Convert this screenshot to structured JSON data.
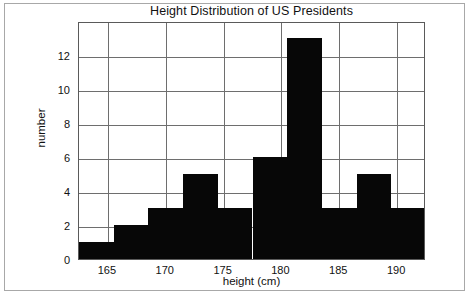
{
  "chart_data": {
    "type": "bar",
    "title": "Height Distribution of US Presidents",
    "xlabel": "height (cm)",
    "ylabel": "number",
    "grid": true,
    "legend": null,
    "xlim": [
      162.5,
      192.5
    ],
    "ylim": [
      0,
      14
    ],
    "xticks": [
      "165",
      "170",
      "175",
      "180",
      "185",
      "190"
    ],
    "xtick_values": [
      165,
      170,
      175,
      180,
      185,
      190
    ],
    "yticks": [
      "0",
      "2",
      "4",
      "6",
      "8",
      "10",
      "12"
    ],
    "ytick_values": [
      0,
      2,
      4,
      6,
      8,
      10,
      12
    ],
    "bin_width": 3,
    "bin_edges": [
      162.5,
      165.5,
      168.5,
      171.5,
      174.5,
      177.5,
      180.5,
      183.5,
      186.5,
      189.5,
      192.5
    ],
    "categories": [
      "162.5-165.5",
      "165.5-168.5",
      "168.5-171.5",
      "171.5-174.5",
      "174.5-177.5",
      "177.5-180.5",
      "180.5-183.5",
      "183.5-186.5",
      "186.5-189.5",
      "189.5-192.5"
    ],
    "values": [
      1,
      2,
      3,
      5,
      3,
      6,
      13,
      3,
      5,
      3
    ],
    "bar_color": "#070707",
    "gridline_color": "#6e6e6e",
    "frame_color": "#5a5a5a",
    "background_color": "#ffffff"
  }
}
